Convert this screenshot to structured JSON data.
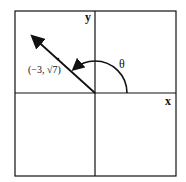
{
  "diagram": {
    "type": "unit-circle-angle",
    "axis_labels": {
      "x": "x",
      "y": "y"
    },
    "angle_label": "θ",
    "point_label": "(−3, √7)",
    "point": {
      "x": -3,
      "y": "√7"
    },
    "colors": {
      "line": "#111111",
      "background": "#ffffff"
    }
  }
}
